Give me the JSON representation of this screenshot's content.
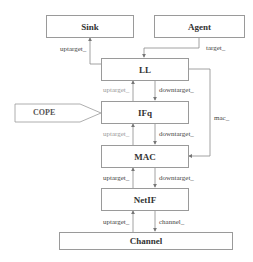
{
  "diagram": {
    "nodes": {
      "sink": "Sink",
      "agent": "Agent",
      "ll": "LL",
      "ifq": "IFq",
      "mac": "MAC",
      "netif": "NetIF",
      "channel": "Channel",
      "cope": "COPE"
    },
    "edges": {
      "ll_to_sink": "uptarget_",
      "agent_to_ll": "target_",
      "ifq_to_ll": "uptarget_",
      "ll_to_ifq": "downtarget_",
      "ll_to_mac": "mac_",
      "mac_to_ifq": "uptarget_",
      "ifq_to_mac": "downtarget_",
      "netif_to_mac": "uptarget_",
      "mac_to_netif": "downtarget_",
      "channel_to_netif": "uptarget_",
      "netif_to_channel": "channel_"
    },
    "colors": {
      "line": "#8a8a8a",
      "border": "#9a9a9a",
      "text": "#333333"
    }
  }
}
